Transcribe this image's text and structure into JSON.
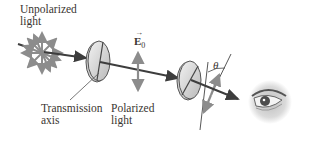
{
  "labels": {
    "unpolarized": "Unpolarized\nlight",
    "transmission_axis": "Transmission\naxis",
    "polarized": "Polarized\nlight",
    "e_field": "E",
    "e_field_sub": "0",
    "angle": "θ"
  },
  "colors": {
    "arrow_gray": "#8a8a8a",
    "beam": "#3d3d3d",
    "text": "#3a3530",
    "polarizer_fill": "#d8d8d8"
  }
}
